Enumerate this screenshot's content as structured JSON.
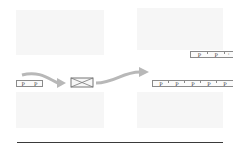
{
  "diagram": {
    "input_stream": {
      "packets": [
        "P",
        "P"
      ]
    },
    "processor": {
      "icon": "x-box-icon"
    },
    "output_upper_stream": {
      "packets": [
        "P",
        "P",
        "'"
      ]
    },
    "output_lower_stream": {
      "packets": [
        "P",
        "P",
        "P",
        "P",
        "P"
      ]
    },
    "colors": {
      "arrow": "#b8b8b8",
      "box_border": "#777777",
      "rule": "#3a3a3a",
      "ghost_block": "#f3f3f3"
    }
  }
}
